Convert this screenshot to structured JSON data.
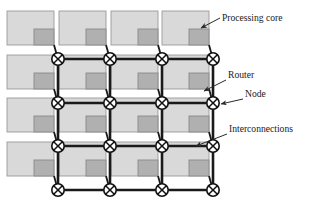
{
  "figure": {
    "background_color": "#ffffff",
    "width": 314,
    "height": 213
  },
  "palette": {
    "core_fill": "#d9d9d9",
    "core_stroke": "#9a9a9a",
    "router_fill": "#b0b0b0",
    "router_stroke": "#8a8a8a",
    "link_color": "#1a1a1a",
    "node_fill": "#ffffff",
    "node_stroke": "#111111",
    "label_color": "#1a1a1a",
    "leader_color": "#2a2a2a"
  },
  "grid": {
    "rows": 4,
    "columns": 4,
    "node_count": 16,
    "node_radius": 6.2,
    "link_width": 2.6,
    "stub_width": 1.8,
    "node_x": [
      58,
      110,
      162,
      213
    ],
    "node_y": [
      59,
      103,
      146,
      190
    ],
    "core": {
      "width": 47,
      "height": 34,
      "offset_x": -51,
      "offset_y": -48,
      "router_width": 20,
      "router_height": 16
    }
  },
  "callouts": [
    {
      "id": "processing-core",
      "label": "Processing core",
      "text_x": 222,
      "text_y": 21,
      "leader": "M 220 18 L 201 28",
      "arrow_x": 199,
      "arrow_y": 29,
      "arrow_angle": 208
    },
    {
      "id": "router",
      "label": "Router",
      "text_x": 228,
      "text_y": 78,
      "leader": "M 226 80 L 204 91",
      "arrow_x": 202,
      "arrow_y": 92,
      "arrow_angle": 207
    },
    {
      "id": "node",
      "label": "Node",
      "text_x": 245,
      "text_y": 97,
      "leader": "M 243 99 L 221 104",
      "arrow_x": 219,
      "arrow_y": 104,
      "arrow_angle": 193
    },
    {
      "id": "interconnections",
      "label": "Interconnections",
      "text_x": 229,
      "text_y": 132,
      "leader": "M 227 134 L 196 146",
      "arrow_x": 194,
      "arrow_y": 147,
      "arrow_angle": 201
    }
  ]
}
